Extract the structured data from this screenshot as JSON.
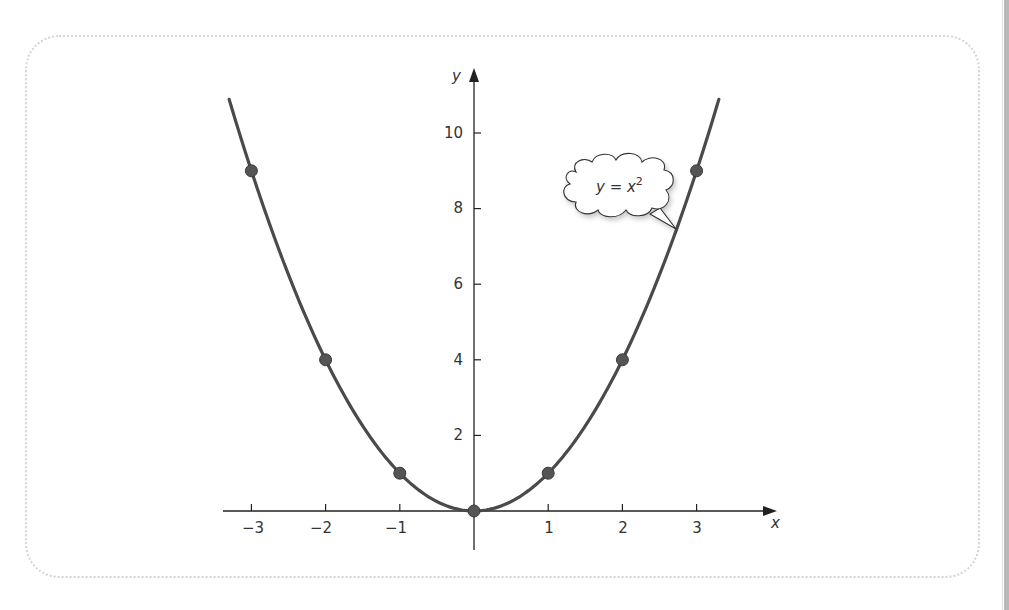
{
  "chart_data": {
    "type": "line",
    "title": "",
    "xlabel": "x",
    "ylabel": "y",
    "function": "y = x^2",
    "x_ticks": [
      -3,
      -2,
      -1,
      1,
      2,
      3
    ],
    "y_ticks": [
      2,
      4,
      6,
      8,
      10
    ],
    "xlim": [
      -3.4,
      3.9
    ],
    "ylim": [
      -1,
      11
    ],
    "grid": false,
    "legend": null,
    "series": [
      {
        "name": "y = x^2",
        "type": "curve",
        "x": [
          -3.3,
          3.3
        ],
        "color": "#4a4a4a"
      },
      {
        "name": "points",
        "type": "scatter",
        "x": [
          -3,
          -2,
          -1,
          0,
          1,
          2,
          3
        ],
        "y": [
          9,
          4,
          1,
          0,
          1,
          4,
          9
        ],
        "color": "#4a4a4a"
      }
    ],
    "annotations": [
      {
        "text": "y = x",
        "superscript": "2",
        "type": "cloud-callout",
        "points_to": [
          2.7,
          7.3
        ]
      }
    ]
  },
  "axes": {
    "x_label": "x",
    "y_label": "y",
    "x_tick_labels": [
      "−3",
      "−2",
      "−1",
      "1",
      "2",
      "3"
    ],
    "y_tick_labels": [
      "2",
      "4",
      "6",
      "8",
      "10"
    ]
  },
  "callout": {
    "text": "y = x",
    "superscript": "2"
  },
  "colors": {
    "curve": "#4a4a4a",
    "points": "#555555",
    "axis": "#222222",
    "frame": "#d4d4d4"
  }
}
